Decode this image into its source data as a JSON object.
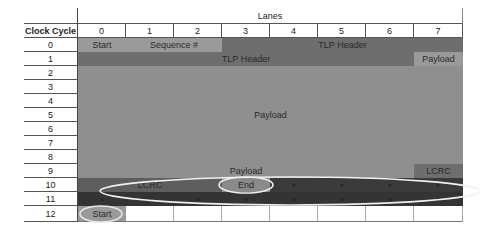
{
  "table": {
    "corner_label": "",
    "lanes_title": "Lanes",
    "row_header_title": "Clock Cycle",
    "lane_headers": [
      "0",
      "1",
      "2",
      "3",
      "4",
      "5",
      "6",
      "7"
    ],
    "clock_cycles": [
      "0",
      "1",
      "2",
      "3",
      "4",
      "5",
      "6",
      "7",
      "8",
      "9",
      "10",
      "11",
      "12"
    ]
  },
  "segments": {
    "start_0": "Start",
    "sequence": "Sequence #",
    "tlp_header_row0": "TLP Header",
    "tlp_header_row1": "TLP Header",
    "payload_row1": "Payload",
    "payload_main": "Payload",
    "payload_row9": "Payload",
    "lcrc_row9": "LCRC",
    "lcrc_row10": "LCRC",
    "end_row10": "End",
    "start_row12": "Start"
  },
  "idle_marks": {
    "symbol": "x",
    "row10_lanes": [
      4,
      5,
      6,
      7
    ],
    "row11_lanes": [
      0,
      1,
      2,
      3,
      4,
      5,
      6,
      7
    ]
  },
  "colors": {
    "light_gray": "#9a9a9a",
    "mid_gray": "#8a8a8a",
    "dark_gray": "#6e6e6e",
    "darker_gray": "#5c5c5c",
    "idle_dark": "#3a3a3a",
    "oval": "#f2f2f2"
  }
}
